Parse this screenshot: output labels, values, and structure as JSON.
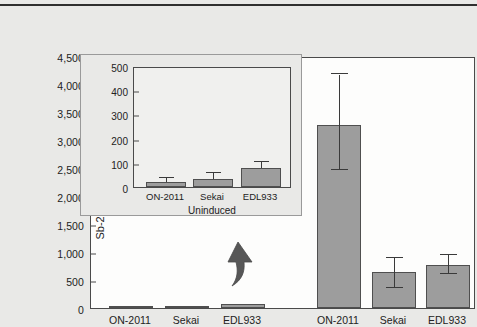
{
  "figure": {
    "background_color": "#e9e9e7",
    "bar_fill_color": "#9d9d9d",
    "bar_edge_color": "#4f4f4f",
    "axis_color": "#4a4a4a"
  },
  "chart_data": {
    "type": "bar",
    "title": "",
    "xlabel": "",
    "ylabel": "Sb-2 produced (mL/ng)",
    "ylim": [
      0,
      4500
    ],
    "yticks": [
      0,
      500,
      1000,
      1500,
      2000,
      2500,
      3000,
      3500,
      4000,
      4500
    ],
    "ytick_labels": [
      "0",
      "500",
      "1,000",
      "1,500",
      "2,000",
      "2,500",
      "3,000",
      "3,500",
      "4,000",
      "4,500"
    ],
    "grid": false,
    "legend": "none",
    "categories": [
      "ON-2011",
      "Sekai",
      "EDL933",
      "ON-2011",
      "Sekai",
      "EDL933"
    ],
    "group_labels": [
      "Uninduced",
      "Mitomycin C induced"
    ],
    "values": [
      20,
      30,
      75,
      3270,
      640,
      770
    ],
    "errors_upper": [
      10,
      18,
      20,
      900,
      250,
      170
    ],
    "errors_lower": [
      10,
      18,
      20,
      810,
      290,
      170
    ],
    "series": [
      {
        "name": "Sb-2 produced (mL/ng)",
        "values": [
          20,
          30,
          75,
          3270,
          640,
          770
        ]
      }
    ]
  },
  "main_axis": {
    "ytick_labels": [
      "4,500",
      "4,000",
      "3,500",
      "3,000",
      "2,500",
      "2,000",
      "1,500",
      "1,000",
      "500",
      "0"
    ],
    "ytick_values": [
      4500,
      4000,
      3500,
      3000,
      2500,
      2000,
      1500,
      1000,
      500,
      0
    ],
    "ylabel": "Sb-2 produced (mL/ng)",
    "xtick_labels": [
      "ON-2011",
      "Sekai",
      "EDL933",
      "ON-2011",
      "Sekai",
      "EDL933"
    ],
    "group_label_left": "Uninduced",
    "group_label_right": "Mitomycin C induced"
  },
  "inset": {
    "chart_data": {
      "type": "bar",
      "title": "",
      "ylabel": "",
      "ylim": [
        0,
        500
      ],
      "yticks": [
        0,
        100,
        200,
        300,
        400,
        500
      ],
      "ytick_labels": [
        "0",
        "100",
        "200",
        "300",
        "400",
        "500"
      ],
      "grid": false,
      "categories": [
        "ON-2011",
        "Sekai",
        "EDL933"
      ],
      "values": [
        22,
        34,
        78
      ],
      "errors_upper": [
        14,
        25,
        25
      ],
      "errors_lower": [
        14,
        25,
        25
      ],
      "group_label": "Uninduced"
    },
    "ytick_labels": [
      "500",
      "400",
      "300",
      "200",
      "100",
      "0"
    ],
    "xtick_labels": [
      "ON-2011",
      "Sekai",
      "EDL933"
    ],
    "group_label": "Uninduced"
  },
  "annotations": {
    "callout_arrow": "arrow-up-icon"
  }
}
